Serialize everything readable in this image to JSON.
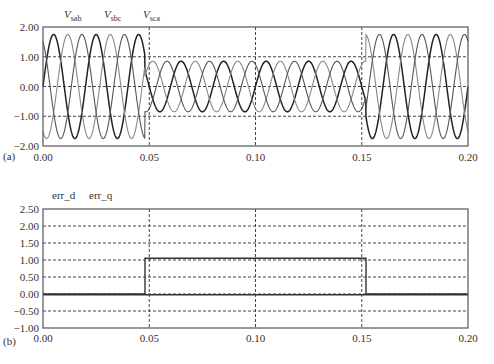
{
  "chart_data": [
    {
      "type": "line",
      "panel_label": "(a)",
      "title": "",
      "xlabel": "",
      "ylabel": "",
      "xlim": [
        0.0,
        0.2
      ],
      "ylim": [
        -2.0,
        2.0
      ],
      "xticks": [
        "0.00",
        "0.05",
        "0.10",
        "0.15",
        "0.20"
      ],
      "xtick_values": [
        0.0,
        0.05,
        0.1,
        0.15,
        0.2
      ],
      "yticks": [
        "2.00",
        "1.00",
        "0.00",
        "−1.00",
        "−2.00"
      ],
      "ytick_values": [
        2.0,
        1.0,
        0.0,
        -1.0,
        -2.0
      ],
      "grid": "dashed",
      "legend": [
        {
          "base": "V",
          "sub": "sab"
        },
        {
          "base": "V",
          "sub": "sbc"
        },
        {
          "base": "V",
          "sub": "sca"
        }
      ],
      "legend_placement": "top-left",
      "frequency_hz": 50,
      "series": [
        {
          "name": "V_sab",
          "phase_deg": 0,
          "color": "#222222"
        },
        {
          "name": "V_sbc",
          "phase_deg": -120,
          "color": "#888888"
        },
        {
          "name": "V_sca",
          "phase_deg": 120,
          "color": "#555555"
        }
      ],
      "segments": [
        {
          "t_start": 0.0,
          "t_end": 0.048,
          "amplitude": 1.75
        },
        {
          "t_start": 0.048,
          "t_end": 0.152,
          "amplitude": 0.85
        },
        {
          "t_start": 0.152,
          "t_end": 0.2,
          "amplitude": 1.75
        }
      ]
    },
    {
      "type": "line",
      "panel_label": "(b)",
      "title": "",
      "xlabel": "",
      "ylabel": "",
      "xlim": [
        0.0,
        0.2
      ],
      "ylim": [
        -1.0,
        2.5
      ],
      "xticks": [
        "0.00",
        "0.05",
        "0.10",
        "0.15",
        "0.20"
      ],
      "xtick_values": [
        0.0,
        0.05,
        0.1,
        0.15,
        0.2
      ],
      "yticks": [
        "2.50",
        "2.00",
        "1.50",
        "1.00",
        "0.50",
        "0.00",
        "−0.50",
        "−1.00"
      ],
      "ytick_values": [
        2.5,
        2.0,
        1.5,
        1.0,
        0.5,
        0.0,
        -0.5,
        -1.0
      ],
      "grid": "dashed",
      "legend": [
        {
          "base": "err_d"
        },
        {
          "base": "err_q"
        }
      ],
      "legend_placement": "top-left",
      "series": [
        {
          "name": "err_d",
          "color": "#333333",
          "points": [
            [
              0.0,
              0.0
            ],
            [
              0.048,
              0.0
            ],
            [
              0.048,
              1.05
            ],
            [
              0.152,
              1.05
            ],
            [
              0.152,
              0.0
            ],
            [
              0.2,
              0.0
            ]
          ]
        },
        {
          "name": "err_q",
          "color": "#333333",
          "points": [
            [
              0.0,
              -0.02
            ],
            [
              0.2,
              -0.02
            ]
          ]
        }
      ]
    }
  ]
}
